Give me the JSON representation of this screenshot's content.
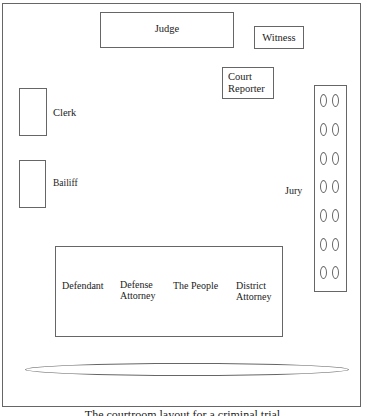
{
  "diagram": {
    "type": "courtroom-layout",
    "labels": {
      "judge": "Judge",
      "witness": "Witness",
      "court_reporter_line1": "Court",
      "court_reporter_line2": "Reporter",
      "clerk": "Clerk",
      "bailiff": "Bailiff",
      "jury": "Jury",
      "defendant": "Defendant",
      "defense_attorney_line1": "Defense",
      "defense_attorney_line2": "Attorney",
      "the_people": "The People",
      "district_attorney_line1": "District",
      "district_attorney_line2": "Attorney"
    },
    "jury_box": {
      "rows": 7,
      "seats_per_row": 2
    },
    "caption": "The courtroom layout for a criminal trial"
  }
}
